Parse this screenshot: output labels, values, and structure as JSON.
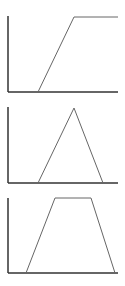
{
  "colors": {
    "axis": "#333333",
    "curve": "#666666",
    "background": "#ffffff"
  },
  "chart_data": [
    {
      "type": "line",
      "name": "ramp-up (R-function / open right shoulder)",
      "title": "",
      "xlabel": "",
      "ylabel": "",
      "axes": {
        "origin": [
          8,
          92
        ],
        "x_end": 118,
        "y_top": 16
      },
      "points": [
        [
          38,
          92
        ],
        [
          74,
          17
        ],
        [
          118,
          17
        ]
      ]
    },
    {
      "type": "line",
      "name": "triangular membership function",
      "title": "",
      "xlabel": "",
      "ylabel": "",
      "axes": {
        "origin": [
          8,
          183
        ],
        "x_end": 118,
        "y_top": 107
      },
      "points": [
        [
          38,
          183
        ],
        [
          74,
          108
        ],
        [
          103,
          183
        ]
      ]
    },
    {
      "type": "line",
      "name": "trapezoidal membership function",
      "title": "",
      "xlabel": "",
      "ylabel": "",
      "axes": {
        "origin": [
          8,
          273
        ],
        "x_end": 118,
        "y_top": 198
      },
      "points": [
        [
          26,
          273
        ],
        [
          55,
          198
        ],
        [
          91,
          198
        ],
        [
          115,
          273
        ]
      ]
    }
  ]
}
